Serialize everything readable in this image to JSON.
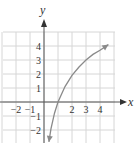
{
  "chart_data": {
    "type": "line",
    "title": "",
    "xlabel": "x",
    "ylabel": "y",
    "xlim": [
      -3,
      5
    ],
    "ylim": [
      -3,
      5.5
    ],
    "grid": true,
    "x_tick_labels": [
      "-2",
      "-1",
      "2",
      "3",
      "4"
    ],
    "y_tick_labels": [
      "4",
      "3",
      "2",
      "1",
      "-1",
      "-2"
    ],
    "series": [
      {
        "name": "curve",
        "description": "increasing logarithmic-shaped curve with arrowheads at both ends, crossing x-axis near x=1",
        "x": [
          0.35,
          0.5,
          0.75,
          1,
          1.5,
          2,
          2.5,
          3,
          3.5,
          4,
          4.6
        ],
        "y": [
          -2.85,
          -1.9,
          -0.8,
          0,
          1.1,
          1.9,
          2.5,
          3.0,
          3.4,
          3.7,
          4.1
        ]
      }
    ]
  }
}
